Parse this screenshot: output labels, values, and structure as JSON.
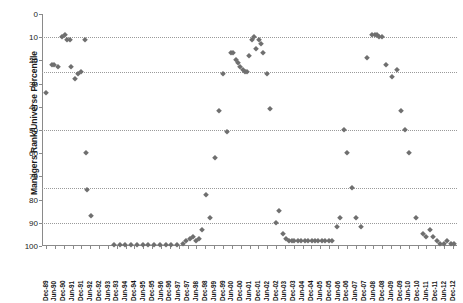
{
  "chart_data": {
    "type": "scatter",
    "title": "",
    "xlabel": "",
    "ylabel": "Managers Rank/Universe Percentile",
    "ylim": [
      0,
      100
    ],
    "y_inverted": true,
    "y_ticks": [
      0,
      10,
      20,
      30,
      40,
      50,
      60,
      70,
      80,
      90,
      100
    ],
    "gridlines": [
      10,
      25,
      50,
      75,
      90
    ],
    "grid": true,
    "legend": "none",
    "marker": "diamond",
    "marker_color": "#6f6f6f",
    "categories": [
      "Dec-89",
      "Jun-90",
      "Dec-90",
      "Jun-91",
      "Dec-91",
      "Jun-92",
      "Dec-92",
      "Jun-93",
      "Dec-93",
      "Jun-94",
      "Dec-94",
      "Jun-95",
      "Dec-95",
      "Jun-96",
      "Dec-96",
      "Jun-97",
      "Dec-97",
      "Jun-97",
      "Dec-97",
      "Jun-98",
      "Dec-98",
      "Jun-99",
      "Dec-99",
      "Jun-00",
      "Dec-00",
      "Jun-01",
      "Dec-01",
      "Jun-02",
      "Dec-02",
      "Jun-03",
      "Dec-03",
      "Jun-04",
      "Dec-04",
      "Jun-05",
      "Dec-05",
      "Jun-06",
      "Dec-06",
      "Jun-07",
      "Dec-07",
      "Jun-08",
      "Dec-08",
      "Jun-09",
      "Dec-09",
      "Jun-10",
      "Dec-10",
      "Jun-11",
      "Dec-11",
      "Jun-12",
      "Dec-12"
    ],
    "x_tick_labels": [
      "Dec-89",
      "Jun-90",
      "Dec-90",
      "Jun-91",
      "Dec-91",
      "Jun-92",
      "Dec-92",
      "Jun-93",
      "Dec-93",
      "Jun-94",
      "Dec-94",
      "Jun-95",
      "Dec-95",
      "Jun-96",
      "Dec-96",
      "Jun-97",
      "Dec-97",
      "Jun-98",
      "Dec-98",
      "Jun-99",
      "Dec-99",
      "Jun-00",
      "Dec-00",
      "Jun-01",
      "Dec-01",
      "Jun-02",
      "Dec-02",
      "Jun-03",
      "Dec-03",
      "Jun-04",
      "Dec-04",
      "Jun-05",
      "Dec-05",
      "Jun-06",
      "Dec-06",
      "Jun-07",
      "Dec-07",
      "Jun-08",
      "Dec-08",
      "Jun-09",
      "Dec-09",
      "Jun-10",
      "Dec-10",
      "Jun-11",
      "Dec-11",
      "Jun-12",
      "Dec-12"
    ],
    "points": [
      {
        "xi": 0.2,
        "y": 34
      },
      {
        "xi": 1.2,
        "y": 22
      },
      {
        "xi": 1.6,
        "y": 22
      },
      {
        "xi": 2.2,
        "y": 23
      },
      {
        "xi": 2.9,
        "y": 10
      },
      {
        "xi": 3.5,
        "y": 9
      },
      {
        "xi": 3.9,
        "y": 11
      },
      {
        "xi": 4.3,
        "y": 11
      },
      {
        "xi": 4.6,
        "y": 23
      },
      {
        "xi": 5.3,
        "y": 28
      },
      {
        "xi": 5.8,
        "y": 26
      },
      {
        "xi": 6.2,
        "y": 25
      },
      {
        "xi": 7.0,
        "y": 11
      },
      {
        "xi": 7.1,
        "y": 60
      },
      {
        "xi": 7.3,
        "y": 76
      },
      {
        "xi": 8.0,
        "y": 87
      },
      {
        "xi": 12.0,
        "y": 100
      },
      {
        "xi": 13.0,
        "y": 100
      },
      {
        "xi": 14.0,
        "y": 100
      },
      {
        "xi": 15.0,
        "y": 100
      },
      {
        "xi": 16.0,
        "y": 100
      },
      {
        "xi": 17.0,
        "y": 100
      },
      {
        "xi": 18.0,
        "y": 100
      },
      {
        "xi": 19.0,
        "y": 100
      },
      {
        "xi": 20.0,
        "y": 100
      },
      {
        "xi": 21.0,
        "y": 100
      },
      {
        "xi": 22.0,
        "y": 100
      },
      {
        "xi": 23.0,
        "y": 100
      },
      {
        "xi": 24.0,
        "y": 99
      },
      {
        "xi": 24.6,
        "y": 98
      },
      {
        "xi": 25.2,
        "y": 97
      },
      {
        "xi": 25.7,
        "y": 96
      },
      {
        "xi": 26.2,
        "y": 98
      },
      {
        "xi": 26.8,
        "y": 97
      },
      {
        "xi": 27.4,
        "y": 93
      },
      {
        "xi": 28.0,
        "y": 78
      },
      {
        "xi": 28.8,
        "y": 88
      },
      {
        "xi": 29.6,
        "y": 62
      },
      {
        "xi": 30.3,
        "y": 42
      },
      {
        "xi": 31.0,
        "y": 26
      },
      {
        "xi": 31.6,
        "y": 51
      },
      {
        "xi": 32.4,
        "y": 17
      },
      {
        "xi": 32.8,
        "y": 17
      },
      {
        "xi": 33.2,
        "y": 20
      },
      {
        "xi": 33.6,
        "y": 21
      },
      {
        "xi": 34.0,
        "y": 23
      },
      {
        "xi": 34.4,
        "y": 24
      },
      {
        "xi": 34.8,
        "y": 25
      },
      {
        "xi": 35.1,
        "y": 25
      },
      {
        "xi": 35.5,
        "y": 18
      },
      {
        "xi": 36.1,
        "y": 11
      },
      {
        "xi": 36.4,
        "y": 10
      },
      {
        "xi": 36.8,
        "y": 15
      },
      {
        "xi": 37.2,
        "y": 11
      },
      {
        "xi": 37.6,
        "y": 13
      },
      {
        "xi": 38.0,
        "y": 17
      },
      {
        "xi": 38.6,
        "y": 26
      },
      {
        "xi": 39.2,
        "y": 41
      },
      {
        "xi": 40.2,
        "y": 90
      },
      {
        "xi": 40.8,
        "y": 85
      },
      {
        "xi": 41.4,
        "y": 95
      },
      {
        "xi": 41.9,
        "y": 97
      },
      {
        "xi": 42.4,
        "y": 98
      },
      {
        "xi": 43.0,
        "y": 98
      },
      {
        "xi": 43.4,
        "y": 98
      },
      {
        "xi": 44.0,
        "y": 98
      },
      {
        "xi": 44.6,
        "y": 98
      },
      {
        "xi": 45.2,
        "y": 98
      },
      {
        "xi": 45.8,
        "y": 98
      },
      {
        "xi": 46.4,
        "y": 98
      },
      {
        "xi": 47.0,
        "y": 98
      },
      {
        "xi": 47.6,
        "y": 98
      },
      {
        "xi": 48.2,
        "y": 98
      },
      {
        "xi": 48.8,
        "y": 98
      },
      {
        "xi": 49.4,
        "y": 98
      },
      {
        "xi": 50.0,
        "y": 98
      },
      {
        "xi": 50.8,
        "y": 92
      },
      {
        "xi": 51.4,
        "y": 88
      },
      {
        "xi": 52.0,
        "y": 50
      },
      {
        "xi": 52.6,
        "y": 60
      },
      {
        "xi": 53.4,
        "y": 75
      },
      {
        "xi": 54.2,
        "y": 88
      },
      {
        "xi": 55.0,
        "y": 92
      },
      {
        "xi": 56.0,
        "y": 19
      },
      {
        "xi": 57.0,
        "y": 9
      },
      {
        "xi": 57.4,
        "y": 9
      },
      {
        "xi": 57.8,
        "y": 9
      },
      {
        "xi": 58.2,
        "y": 10
      },
      {
        "xi": 58.6,
        "y": 10
      },
      {
        "xi": 59.4,
        "y": 22
      },
      {
        "xi": 60.4,
        "y": 27
      },
      {
        "xi": 61.2,
        "y": 24
      },
      {
        "xi": 62.0,
        "y": 42
      },
      {
        "xi": 62.6,
        "y": 50
      },
      {
        "xi": 63.4,
        "y": 60
      },
      {
        "xi": 64.6,
        "y": 88
      },
      {
        "xi": 65.8,
        "y": 95
      },
      {
        "xi": 66.4,
        "y": 96
      },
      {
        "xi": 67.0,
        "y": 93
      },
      {
        "xi": 67.6,
        "y": 96
      },
      {
        "xi": 68.2,
        "y": 98
      },
      {
        "xi": 68.8,
        "y": 99
      },
      {
        "xi": 69.4,
        "y": 99
      },
      {
        "xi": 70.0,
        "y": 98
      },
      {
        "xi": 70.6,
        "y": 99
      },
      {
        "xi": 71.2,
        "y": 99
      }
    ]
  }
}
